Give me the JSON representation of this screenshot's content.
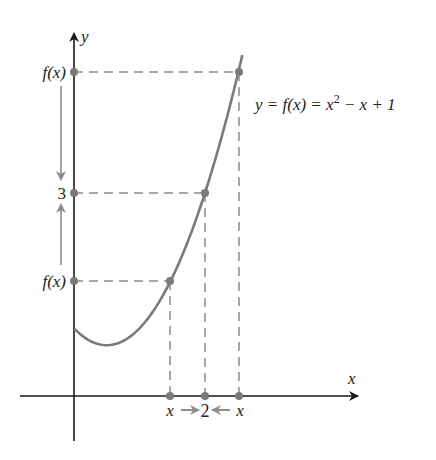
{
  "figure": {
    "equation_label": "y = f(x) = x² − x + 1",
    "equation_parts": {
      "lhs": "y = f(x) = x",
      "exp": "2",
      "rhs": " − x + 1"
    },
    "axes": {
      "x_label": "x",
      "y_label": "y"
    },
    "y_labels": {
      "top": "f(x)",
      "middle": "3",
      "bottom": "f(x)"
    },
    "x_labels": {
      "left": "x",
      "middle": "2",
      "right": "x"
    },
    "colors": {
      "curve": "#7a7a7a",
      "axis": "#1a1a1a",
      "dashed": "#8c8c8c",
      "points": "#7a7a7a",
      "arrows": "#8c8c8c"
    },
    "function": {
      "a": 1,
      "b": -1,
      "c": 1,
      "x_start": 0,
      "x_end": 2.57
    },
    "key_points": [
      {
        "x": 1.466,
        "y": 1.683,
        "desc": "x approaching from left"
      },
      {
        "x": 2,
        "y": 3,
        "desc": "limit point"
      },
      {
        "x": 2.52,
        "y": 4.83,
        "desc": "x approaching from right"
      }
    ],
    "pixel_mapping": {
      "origin_x": 74,
      "origin_y": 396,
      "x_scale": 65.5,
      "y_scale": 67.7
    }
  }
}
